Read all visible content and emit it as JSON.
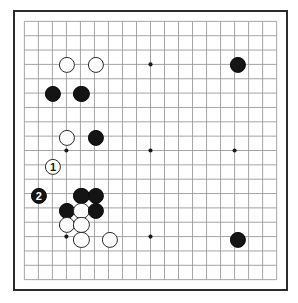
{
  "diagram": {
    "type": "go-board-diagram",
    "board_size": 19,
    "board_width_px": 275,
    "board_height_px": 281,
    "board_left_px": 13,
    "board_top_px": 10,
    "cell_px": 15.25,
    "colors": {
      "background": "#ffffff",
      "grid_line": "#9a9a9a",
      "border": "#2b2b2b",
      "black_stone": "#141414",
      "white_stone": "#ffffff",
      "white_stone_edge": "#2b2b2b",
      "star_point": "#1a1a1a",
      "black_label_text": "#ffffff",
      "white_label_text": "#141414"
    },
    "star_points": [
      {
        "col": 3,
        "row": 3
      },
      {
        "col": 9,
        "row": 3
      },
      {
        "col": 15,
        "row": 3
      },
      {
        "col": 3,
        "row": 9
      },
      {
        "col": 9,
        "row": 9
      },
      {
        "col": 15,
        "row": 9
      },
      {
        "col": 3,
        "row": 15
      },
      {
        "col": 9,
        "row": 15
      },
      {
        "col": 15,
        "row": 15
      }
    ],
    "stones": [
      {
        "color": "white",
        "col": 3,
        "row": 3,
        "label": "",
        "name": "white-stone-d16"
      },
      {
        "color": "white",
        "col": 5,
        "row": 3,
        "label": "",
        "name": "white-stone-f16"
      },
      {
        "color": "black",
        "col": 15,
        "row": 3,
        "label": "",
        "name": "black-stone-q16"
      },
      {
        "color": "black",
        "col": 2,
        "row": 5,
        "label": "",
        "name": "black-stone-c14"
      },
      {
        "color": "black",
        "col": 4,
        "row": 5,
        "label": "",
        "name": "black-stone-e14"
      },
      {
        "color": "white",
        "col": 3,
        "row": 8,
        "label": "",
        "name": "white-stone-d11"
      },
      {
        "color": "black",
        "col": 5,
        "row": 8,
        "label": "",
        "name": "black-stone-f11"
      },
      {
        "color": "white",
        "col": 2,
        "row": 10,
        "label": "1",
        "name": "white-stone-move-1"
      },
      {
        "color": "black",
        "col": 1,
        "row": 12,
        "label": "2",
        "name": "black-stone-move-2"
      },
      {
        "color": "black",
        "col": 4,
        "row": 12,
        "label": "",
        "name": "black-stone-e7"
      },
      {
        "color": "black",
        "col": 5,
        "row": 12,
        "label": "",
        "name": "black-stone-f7"
      },
      {
        "color": "black",
        "col": 3,
        "row": 13,
        "label": "",
        "name": "black-stone-d6"
      },
      {
        "color": "white",
        "col": 4,
        "row": 13,
        "label": "",
        "name": "white-stone-e6"
      },
      {
        "color": "black",
        "col": 5,
        "row": 13,
        "label": "",
        "name": "black-stone-f6"
      },
      {
        "color": "white",
        "col": 3,
        "row": 14,
        "label": "",
        "name": "white-stone-d5"
      },
      {
        "color": "white",
        "col": 4,
        "row": 14,
        "label": "",
        "name": "white-stone-e5"
      },
      {
        "color": "white",
        "col": 4,
        "row": 15,
        "label": "",
        "name": "white-stone-e4"
      },
      {
        "color": "white",
        "col": 6,
        "row": 15,
        "label": "",
        "name": "white-stone-g4"
      },
      {
        "color": "black",
        "col": 15,
        "row": 15,
        "label": "",
        "name": "black-stone-q4"
      }
    ]
  }
}
